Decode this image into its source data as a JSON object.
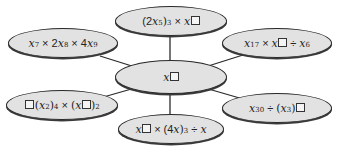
{
  "diagram": {
    "type": "spider-diagram",
    "topic": "index laws - find the missing power",
    "center": {
      "id": "center",
      "base": "x",
      "exponent_placeholder": "□"
    },
    "nodes": [
      {
        "id": "top",
        "expression": "(2x^5)^3 × x^□",
        "parts": {
          "open": "(2",
          "var": "x",
          "exp1": "5",
          "close": ")",
          "exp2": "3",
          "op": "×",
          "var2": "x"
        }
      },
      {
        "id": "top-left",
        "expression": "x^7 × 2x^8 × 4x^9",
        "parts": {
          "var": "x",
          "exp1": "7",
          "op1": "×",
          "coef2": "2",
          "exp2": "8",
          "op2": "×",
          "coef3": "4",
          "exp3": "9"
        }
      },
      {
        "id": "top-right",
        "expression": "x^17 × x^□ ÷ x^6",
        "parts": {
          "var": "x",
          "exp1": "17",
          "op1": "×",
          "op2": "÷",
          "exp3": "6"
        }
      },
      {
        "id": "bottom-left",
        "expression": "□(x^2)^4 × (x^□)^2",
        "parts": {
          "open": "(",
          "var": "x",
          "exp1": "2",
          "close": ")",
          "exp2": "4",
          "op": "×",
          "exp3": "2"
        }
      },
      {
        "id": "bottom",
        "expression": "x^□ × (4x)^3 ÷ x",
        "parts": {
          "var": "x",
          "op1": "×",
          "open": "(4",
          "close": ")",
          "exp": "3",
          "op2": "÷"
        }
      },
      {
        "id": "bottom-right",
        "expression": "x^30 ÷ (x^3)^□",
        "parts": {
          "var": "x",
          "exp1": "30",
          "op": "÷",
          "open": "(",
          "exp2": "3",
          "close": ")"
        }
      }
    ],
    "connectors": [
      {
        "from": "center",
        "to": "top"
      },
      {
        "from": "center",
        "to": "top-left"
      },
      {
        "from": "center",
        "to": "top-right"
      },
      {
        "from": "center",
        "to": "bottom-left"
      },
      {
        "from": "center",
        "to": "bottom"
      },
      {
        "from": "center",
        "to": "bottom-right"
      }
    ],
    "colors": {
      "node_fill": "#e2e2e2",
      "node_border": "#2a2a2a",
      "connector": "#2a2a2a",
      "background": "#ffffff"
    }
  }
}
